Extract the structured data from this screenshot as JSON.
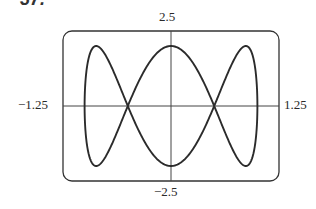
{
  "problem": {
    "label": "37."
  },
  "chart_data": {
    "type": "line",
    "title": "",
    "parametric": {
      "x": "cos(t)",
      "y": "2*sin(3*t)",
      "t_range": [
        0,
        6.283185
      ]
    },
    "xlim": [
      -1.25,
      1.25
    ],
    "ylim": [
      -2.5,
      2.5
    ],
    "xlabel": "",
    "ylabel": "",
    "tick_labels": {
      "xmin": "−1.25",
      "xmax": "1.25",
      "ymin": "−2.5",
      "ymax": "2.5"
    },
    "grid": false,
    "legend": null,
    "series": [
      {
        "name": "curve",
        "points_sampled": "x in [-1,1], y in [-2,2]"
      }
    ]
  },
  "style": {
    "line_color": "#2b2b2b",
    "frame_color": "#333333",
    "axis_color": "#444444"
  }
}
